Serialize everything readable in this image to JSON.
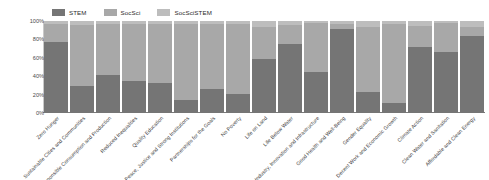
{
  "chart_data": {
    "type": "bar",
    "subtype": "stacked-percentage",
    "title": "",
    "xlabel": "",
    "ylabel": "",
    "ylim": [
      0,
      100
    ],
    "ytick_labels": [
      "100%",
      "80%",
      "60%",
      "40%",
      "20%",
      "0%"
    ],
    "ytick_values": [
      100,
      80,
      60,
      40,
      20,
      0
    ],
    "grid": false,
    "legend_position": "top-left",
    "orientation": "vertical",
    "categories": [
      "Zero Hunger",
      "Sustainable Cities and Communities",
      "Responsible Consumption and Production",
      "Reduced Inequalities",
      "Quality Education",
      "Peace, Justice and Strong Institutions",
      "Partnerships for the Goals",
      "No Poverty",
      "Life on Land",
      "Life Below Water",
      "Industry, Innovation and Infrastructure",
      "Good Health and Well-Being",
      "Gender Equality",
      "Decent Work and Economic Growth",
      "Climate Action",
      "Clean Water and Sanitation",
      "Affordable and Clean Energy"
    ],
    "series": [
      {
        "name": "STEM",
        "color": "#757575",
        "values": [
          77,
          29,
          41,
          35,
          33,
          14,
          26,
          21,
          59,
          75,
          45,
          91,
          23,
          11,
          72,
          66,
          84
        ]
      },
      {
        "name": "SocSci",
        "color": "#a8a8a8",
        "values": [
          20,
          67,
          56,
          62,
          64,
          83,
          71,
          76,
          35,
          21,
          53,
          6,
          71,
          86,
          23,
          32,
          9
        ]
      },
      {
        "name": "SocSciSTEM",
        "color": "#bdbdbd",
        "values": [
          3,
          4,
          3,
          3,
          3,
          3,
          3,
          3,
          6,
          4,
          2,
          3,
          6,
          3,
          5,
          2,
          7
        ]
      }
    ]
  },
  "legend": {
    "items": [
      {
        "label": "STEM",
        "color": "#757575"
      },
      {
        "label": "SocSci",
        "color": "#a8a8a8"
      },
      {
        "label": "SocSciSTEM",
        "color": "#bdbdbd"
      }
    ]
  }
}
